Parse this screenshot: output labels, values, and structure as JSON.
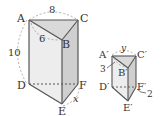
{
  "prism_large": {
    "vertices": {
      "A": "A",
      "B": "B",
      "C": "C",
      "D": "D",
      "E": "E",
      "F": "F"
    },
    "measures": {
      "AC": "8",
      "AB": "6",
      "AD": "10",
      "EF": "x"
    }
  },
  "prism_small": {
    "vertices": {
      "A": "A′",
      "B": "B′",
      "C": "C′",
      "D": "D′",
      "E": "E′",
      "F": "F′"
    },
    "measures": {
      "AC": "y",
      "AB": "3",
      "EF": "2"
    }
  },
  "colors": {
    "edge": "#555555",
    "top_face": "#dcdcdc",
    "front_face": "#eeeeee",
    "side_face": "#d0d0d0",
    "dashed_arc": "#999999"
  }
}
